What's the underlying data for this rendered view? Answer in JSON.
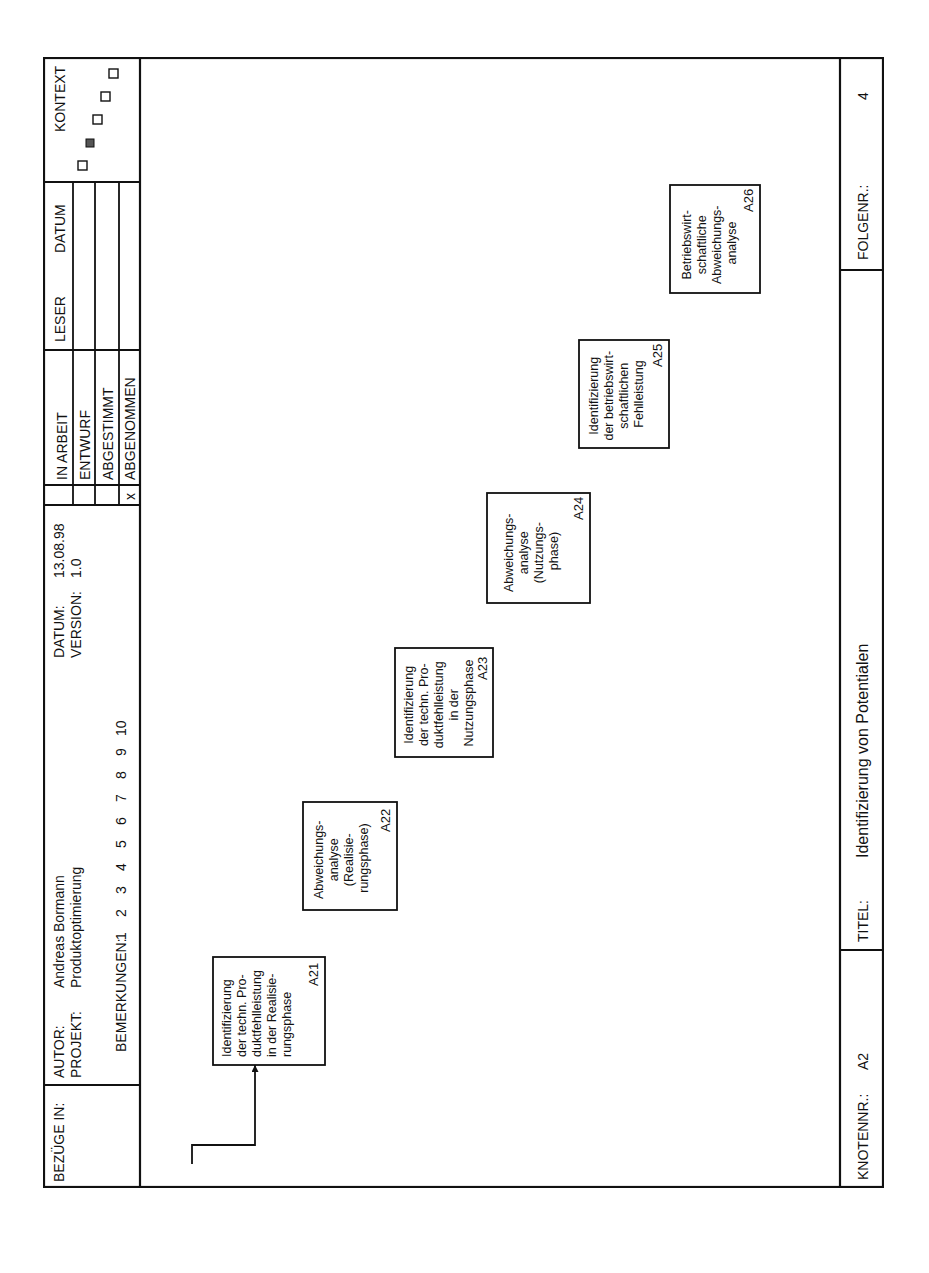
{
  "header": {
    "bezuege_label": "BEZÜGE IN:",
    "autor_label": "AUTOR:",
    "autor_value": "Andreas Bormann",
    "projekt_label": "PROJEKT:",
    "projekt_value": "Produktoptimierung",
    "datum_label": "DATUM:",
    "datum_value": "13.08.98",
    "version_label": "VERSION:",
    "version_value": "1.0",
    "bemerkungen_label": "BEMERKUNGEN:",
    "bemerkungen_numbers": [
      "1",
      "2",
      "3",
      "4",
      "5",
      "6",
      "7",
      "8",
      "9",
      "10"
    ],
    "status": [
      {
        "label": "IN ARBEIT",
        "checked": ""
      },
      {
        "label": "ENTWURF",
        "checked": ""
      },
      {
        "label": "ABGESTIMMT",
        "checked": ""
      },
      {
        "label": "ABGENOMMEN",
        "checked": "x"
      }
    ],
    "leser_label": "LESER",
    "datum_col_label": "DATUM",
    "kontext_label": "KONTEXT"
  },
  "footer": {
    "knotennr_label": "KNOTENNR.:",
    "knotennr_value": "A2",
    "titel_label": "TITEL:",
    "titel_value": "Identifizierung von Potentialen",
    "folgenr_label": "FOLGENR.:",
    "folgenr_value": "4"
  },
  "diagram": {
    "activities": [
      {
        "id": "A21",
        "lines": [
          "Identifizierung",
          "der techn. Pro-",
          "duktfehlleistung",
          "in der Realisie-",
          "rungsphase"
        ]
      },
      {
        "id": "A22",
        "lines": [
          "Abweichungs-",
          "analyse",
          "(Realisie-",
          "rungsphase)"
        ]
      },
      {
        "id": "A23",
        "lines": [
          "Identifizierung",
          "der techn. Pro-",
          "duktfehlleistung",
          "in der",
          "Nutzungsphase"
        ]
      },
      {
        "id": "A24",
        "lines": [
          "Abweichungs-",
          "analyse",
          "(Nutzungs-",
          "phase)"
        ]
      },
      {
        "id": "A25",
        "lines": [
          "Identifizierung",
          "der betriebswirt-",
          "schaftlichen",
          "Fehlleistung"
        ]
      },
      {
        "id": "A26",
        "lines": [
          "Betriebswirt-",
          "schaftliche",
          "Abweichungs-",
          "analyse"
        ]
      }
    ],
    "inputs": [
      {
        "lines": [
          "strukturierte",
          "Produktdaten",
          "I1"
        ]
      },
      {
        "lines": [
          "Wettbe-",
          "werbsstrategie",
          "I2"
        ]
      },
      {
        "lines": [
          "Unternehmens-",
          "strategie",
          "I3"
        ]
      }
    ],
    "controls_a21": [
      "Prüfpläne",
      "Prüfprozesse",
      "Prüfmerkmale"
    ],
    "mechanisms_a21": [
      {
        "lines": [
          "Prüfpro-",
          "zeßplan"
        ]
      },
      {
        "lines": [
          "Informa-",
          "tions-",
          "modell",
          "(IM)"
        ]
      },
      {
        "lines": [
          "Lebenszyklus-",
          "orientiertes Pro-",
          "duktdatenmodell",
          "(LPM)"
        ]
      },
      {
        "lines": [
          "Lebens-",
          "zyklus"
        ]
      },
      {
        "lines": [
          "Histo-",
          "gramm"
        ]
      }
    ],
    "mechanisms_a22": [
      {
        "lines": [
          "Produkt-",
          "modell",
          "(PM)"
        ]
      },
      {
        "lines": [
          "Lebens-",
          "zyklus"
        ]
      }
    ],
    "mechanisms_a23": [
      {
        "lines": [
          "Produkt-",
          "modell",
          "(PM)"
        ]
      },
      {
        "lines": [
          "Weibull-",
          "Verteilung"
        ]
      },
      {
        "lines": [
          "Lebenszyklus-",
          "orientiertes Pro-",
          "duktdatenmodell",
          "(LPM)"
        ]
      }
    ],
    "mechanisms_a24": [
      {
        "lines": [
          "Produkt-",
          "modell",
          "(PM)"
        ]
      },
      {
        "lines": [
          "Lebens-",
          "zyklus"
        ]
      }
    ],
    "mechanisms_a25": [
      {
        "lines": [
          "Prozeß-",
          "plan"
        ]
      },
      {
        "lines": [
          "Informa-",
          "tions-",
          "modell",
          "(IM)"
        ]
      },
      {
        "lines": [
          "Ressourcen-",
          "modell",
          "(RM)"
        ]
      },
      {
        "lines": [
          "Produkt-",
          "modell",
          "(PM)"
        ]
      }
    ],
    "mechanisms_a26": [
      {
        "lines": [
          "Algorithmus"
        ]
      }
    ],
    "flows": [
      {
        "lines": [
          "identifizierte",
          "Produktfehlleistung",
          "(Realisierungsphase)"
        ]
      },
      {
        "lines": [
          "klassifizierte Produkt-",
          "strukturelemente",
          "(Realisierungsphase)"
        ]
      },
      {
        "lines": [
          "identifizierte",
          "Produktfehlleistung",
          "(Nutzungsphase)"
        ]
      },
      {
        "lines": [
          "klassifizierte Produkt-",
          "strukturelemente",
          "(Nutzungsphase)"
        ]
      },
      {
        "lines": [
          "klassifizierte",
          "Produktstruktur-",
          "elemente"
        ]
      }
    ],
    "output": {
      "lines": [
        "Klassifizierte",
        "Produktstruktur-",
        "elemente"
      ],
      "id": "O2"
    }
  }
}
